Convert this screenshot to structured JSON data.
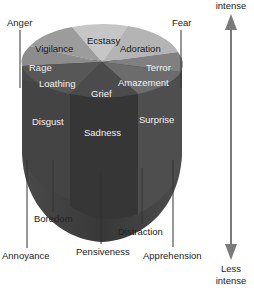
{
  "diagram": {
    "title": "",
    "axis": {
      "top_label": "intense",
      "bottom_label_line1": "Less",
      "bottom_label_line2": "intense"
    },
    "top_disc_labels": {
      "vigilance": "Vigilance",
      "ecstasy": "Ecstasy",
      "adoration": "Adoration",
      "rage": "Rage",
      "terror": "Terror",
      "loathing": "Loathing",
      "grief": "Grief",
      "amazement": "Amazement"
    },
    "middle_labels": {
      "disgust": "Disgust",
      "sadness": "Sadness",
      "surprise": "Surprise"
    },
    "outer_labels": {
      "anger": "Anger",
      "fear": "Fear",
      "annoyance": "Annoyance",
      "boredom": "Boredom",
      "pensiveness": "Pensiveness",
      "distraction": "Distraction",
      "apprehension": "Apprehension"
    },
    "colors": {
      "ecstasy": "#c4c4c4",
      "adoration": "#b8b8b8",
      "vigilance": "#9a9a9a",
      "rage": "#8a8a8a",
      "terror": "#7e7e7e",
      "amazement": "#6e6e6e",
      "loathing": "#555555",
      "grief": "#4a4a4a",
      "body": "#3c3c3c",
      "arrow": "#7a7a7a"
    }
  }
}
